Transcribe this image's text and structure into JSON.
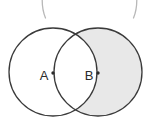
{
  "figure": {
    "kind": "venn-diagram",
    "width": 151,
    "height": 129,
    "background_color": "#ffffff"
  },
  "style": {
    "outline_color": "#3a3a3a",
    "outline_width": 1.3,
    "shade_color": "#e8e8e8",
    "unshaded_color": "#ffffff",
    "label_color": "#2b2b2b",
    "center_dot_color": "#2b2b2b",
    "bracket_color": "#b8b8b8",
    "bracket_width": 1.3
  },
  "sets": [
    {
      "id": "set-a",
      "label": "A",
      "cx": 53,
      "cy": 72,
      "r": 44,
      "label_x": 44,
      "label_y": 75,
      "dot_x": 53,
      "dot_y": 73,
      "shaded": false
    },
    {
      "id": "set-b",
      "label": "B",
      "cx": 98,
      "cy": 72,
      "r": 44,
      "label_x": 89,
      "label_y": 75,
      "dot_x": 98,
      "dot_y": 73,
      "shaded": true
    }
  ],
  "shaded_region": {
    "id": "region-b-minus-a",
    "expression": "B \\ A",
    "fill": "#e8e8e8"
  },
  "brackets": {
    "left": {
      "name": "left-parenthesis",
      "path": "M 48.5 -26 C 41 -12 40.5 6 45.5 18",
      "color": "#b8b8b8"
    },
    "right": {
      "name": "right-parenthesis",
      "path": "M 130.5 -26 C 138 -12 138.5 6 133.5 18",
      "color": "#b8b8b8"
    }
  }
}
